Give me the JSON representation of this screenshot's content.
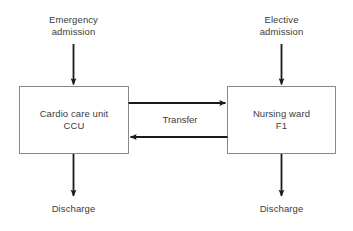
{
  "diagram": {
    "background_color": "#ffffff",
    "line_color": "#1a1a1a",
    "box_border_color": "#808080",
    "text_color": "#3b3b3b",
    "nodes": [
      {
        "id": "ccu",
        "line1": "Cardio care unit",
        "line2": "CCU",
        "text": "Cardio care unit\nCCU"
      },
      {
        "id": "ward",
        "line1": "Nursing ward",
        "line2": "F1",
        "text": "Nursing ward\nF1"
      }
    ],
    "inputs": [
      {
        "id": "emergency",
        "line1": "Emergency",
        "line2": "admission",
        "text": "Emergency\nadmission"
      },
      {
        "id": "elective",
        "line1": "Elective",
        "line2": "admission",
        "text": "Elective\nadmission"
      }
    ],
    "outputs": [
      {
        "id": "discharge-ccu",
        "text": "Discharge"
      },
      {
        "id": "discharge-ward",
        "text": "Discharge"
      }
    ],
    "edges": [
      {
        "id": "transfer",
        "text": "Transfer",
        "from": "ccu",
        "to": "ward"
      }
    ]
  }
}
